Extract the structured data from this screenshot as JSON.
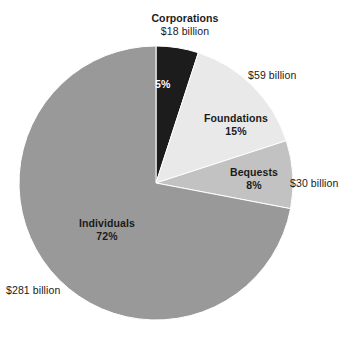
{
  "chart_data": {
    "type": "pie",
    "title": "",
    "subtitle": "",
    "xlabel": "",
    "ylabel": "",
    "legend_position": "none",
    "grid": false,
    "units": "billion US dollars",
    "total_value": 388,
    "start_angle_deg": 0,
    "direction": "clockwise",
    "categories": [
      "Corporations",
      "Foundations",
      "Bequests",
      "Individuals"
    ],
    "values": [
      18,
      59,
      30,
      281
    ],
    "percentages": [
      5,
      15,
      8,
      72
    ],
    "colors": [
      "#1c1c1c",
      "#e9e9e9",
      "#c2c2c2",
      "#999999"
    ],
    "slices": [
      {
        "name": "Corporations",
        "value": 18,
        "value_label": "$18 billion",
        "percent": 5,
        "percent_label": "5%",
        "color": "#1c1c1c",
        "label_placement": "outside-top",
        "percent_label_placement": "inside",
        "percent_label_color": "#ffffff"
      },
      {
        "name": "Foundations",
        "value": 59,
        "value_label": "$59 billion",
        "percent": 15,
        "percent_label": "15%",
        "color": "#e9e9e9",
        "label_placement": "inside",
        "value_label_placement": "outside-right",
        "percent_label_color": "#1b1b1b"
      },
      {
        "name": "Bequests",
        "value": 30,
        "value_label": "$30 billion",
        "percent": 8,
        "percent_label": "8%",
        "color": "#c2c2c2",
        "label_placement": "inside",
        "value_label_placement": "outside-right",
        "percent_label_color": "#1b1b1b"
      },
      {
        "name": "Individuals",
        "value": 281,
        "value_label": "$281 billion",
        "percent": 72,
        "percent_label": "72%",
        "color": "#999999",
        "label_placement": "inside",
        "value_label_placement": "outside-left",
        "percent_label_color": "#1b1b1b"
      }
    ]
  },
  "labels": {
    "corporations_name": "Corporations",
    "corporations_value": "$18 billion",
    "corporations_pct": "5%",
    "foundations_name": "Foundations",
    "foundations_pct": "15%",
    "foundations_value": "$59 billion",
    "bequests_name": "Bequests",
    "bequests_pct": "8%",
    "bequests_value": "$30 billion",
    "individuals_name": "Individuals",
    "individuals_pct": "72%",
    "individuals_value": "$281 billion"
  },
  "geometry": {
    "cx": 156,
    "cy": 183,
    "r": 137
  }
}
